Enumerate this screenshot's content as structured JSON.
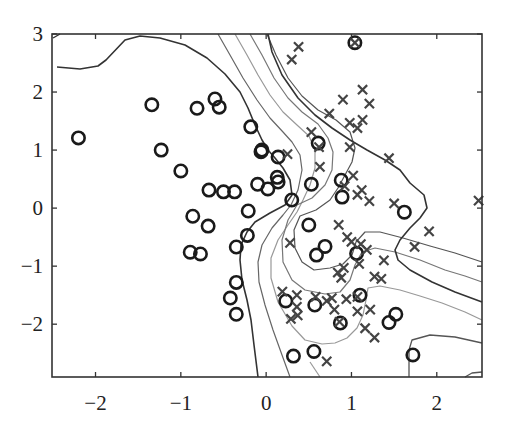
{
  "chart_data": {
    "type": "scatter",
    "title": "",
    "xlabel": "",
    "ylabel": "",
    "xlim": [
      -2.51,
      2.53
    ],
    "ylim": [
      -2.91,
      3.0
    ],
    "x_ticks": [
      -2,
      -1,
      0,
      1,
      2
    ],
    "y_ticks": [
      -2,
      -1,
      0,
      1,
      2,
      3
    ],
    "x_tick_labels": [
      "−2",
      "−1",
      "0",
      "1",
      "2"
    ],
    "y_tick_labels": [
      "−2",
      "−1",
      "0",
      "1",
      "2",
      "3"
    ],
    "grid": false,
    "legend": null,
    "series": [
      {
        "name": "class-circle",
        "marker": "o",
        "color": "#1a1a1a",
        "points": [
          [
            -2.2,
            1.21
          ],
          [
            -1.34,
            1.78
          ],
          [
            -1.23,
            1.0
          ],
          [
            -1.0,
            0.64
          ],
          [
            -0.81,
            1.72
          ],
          [
            -0.6,
            1.88
          ],
          [
            -0.55,
            1.74
          ],
          [
            -0.18,
            1.4
          ],
          [
            -0.05,
            1.0
          ],
          [
            -0.06,
            0.97
          ],
          [
            0.14,
            0.88
          ],
          [
            -0.67,
            0.31
          ],
          [
            -0.5,
            0.28
          ],
          [
            -0.37,
            0.28
          ],
          [
            -0.1,
            0.41
          ],
          [
            0.13,
            0.53
          ],
          [
            0.14,
            0.45
          ],
          [
            0.02,
            0.33
          ],
          [
            0.3,
            0.14
          ],
          [
            -0.86,
            -0.14
          ],
          [
            -0.68,
            -0.31
          ],
          [
            -0.21,
            -0.05
          ],
          [
            -0.22,
            -0.47
          ],
          [
            -0.89,
            -0.76
          ],
          [
            -0.77,
            -0.79
          ],
          [
            -0.35,
            -0.67
          ],
          [
            -0.35,
            -1.28
          ],
          [
            -0.42,
            -1.55
          ],
          [
            -0.35,
            -1.83
          ],
          [
            0.61,
            1.12
          ],
          [
            0.53,
            0.41
          ],
          [
            0.88,
            0.48
          ],
          [
            0.89,
            0.19
          ],
          [
            0.5,
            -0.29
          ],
          [
            0.69,
            -0.66
          ],
          [
            0.59,
            -0.81
          ],
          [
            1.06,
            -0.78
          ],
          [
            1.62,
            -0.07
          ],
          [
            0.23,
            -1.6
          ],
          [
            0.57,
            -1.67
          ],
          [
            1.1,
            -1.5
          ],
          [
            0.87,
            -1.98
          ],
          [
            1.52,
            -1.83
          ],
          [
            1.44,
            -1.97
          ],
          [
            0.32,
            -2.55
          ],
          [
            0.56,
            -2.47
          ],
          [
            1.72,
            -2.53
          ],
          [
            1.04,
            2.85
          ]
        ]
      },
      {
        "name": "class-cross",
        "marker": "x",
        "color": "#444444",
        "points": [
          [
            0.38,
            2.78
          ],
          [
            0.3,
            2.56
          ],
          [
            1.04,
            2.85
          ],
          [
            0.9,
            1.87
          ],
          [
            1.13,
            2.04
          ],
          [
            1.21,
            1.8
          ],
          [
            0.74,
            1.63
          ],
          [
            0.98,
            1.47
          ],
          [
            1.07,
            1.38
          ],
          [
            1.13,
            1.52
          ],
          [
            0.53,
            1.31
          ],
          [
            0.62,
            1.05
          ],
          [
            0.98,
            1.05
          ],
          [
            1.44,
            0.86
          ],
          [
            0.25,
            0.93
          ],
          [
            0.63,
            0.71
          ],
          [
            1.02,
            0.56
          ],
          [
            0.92,
            0.38
          ],
          [
            1.12,
            0.31
          ],
          [
            1.07,
            0.23
          ],
          [
            1.21,
            0.12
          ],
          [
            1.5,
            0.08
          ],
          [
            1.91,
            -0.4
          ],
          [
            1.74,
            -0.67
          ],
          [
            2.49,
            0.13
          ],
          [
            0.28,
            -0.6
          ],
          [
            0.85,
            -0.29
          ],
          [
            0.95,
            -0.5
          ],
          [
            1.0,
            -0.58
          ],
          [
            1.11,
            -0.62
          ],
          [
            1.18,
            -0.72
          ],
          [
            1.38,
            -0.9
          ],
          [
            0.91,
            -1.03
          ],
          [
            1.09,
            -0.96
          ],
          [
            0.88,
            -1.2
          ],
          [
            0.84,
            -1.11
          ],
          [
            1.27,
            -1.18
          ],
          [
            1.35,
            -1.22
          ],
          [
            0.19,
            -1.44
          ],
          [
            0.36,
            -1.5
          ],
          [
            0.58,
            -1.53
          ],
          [
            0.71,
            -1.6
          ],
          [
            0.77,
            -1.55
          ],
          [
            0.94,
            -1.57
          ],
          [
            1.07,
            -1.53
          ],
          [
            0.8,
            -1.75
          ],
          [
            0.36,
            -1.7
          ],
          [
            0.37,
            -1.85
          ],
          [
            0.29,
            -1.91
          ],
          [
            1.16,
            -2.07
          ],
          [
            1.07,
            -1.78
          ],
          [
            1.27,
            -2.23
          ],
          [
            0.86,
            -1.96
          ],
          [
            0.71,
            -2.64
          ],
          [
            1.22,
            -1.75
          ]
        ]
      }
    ],
    "contours": [
      {
        "level": "outer-left",
        "color": "#333333"
      },
      {
        "level": "inner-1",
        "color": "#777777"
      },
      {
        "level": "inner-2",
        "color": "#999999"
      },
      {
        "level": "inner-3",
        "color": "#777777"
      },
      {
        "level": "outer-right",
        "color": "#333333"
      }
    ]
  }
}
